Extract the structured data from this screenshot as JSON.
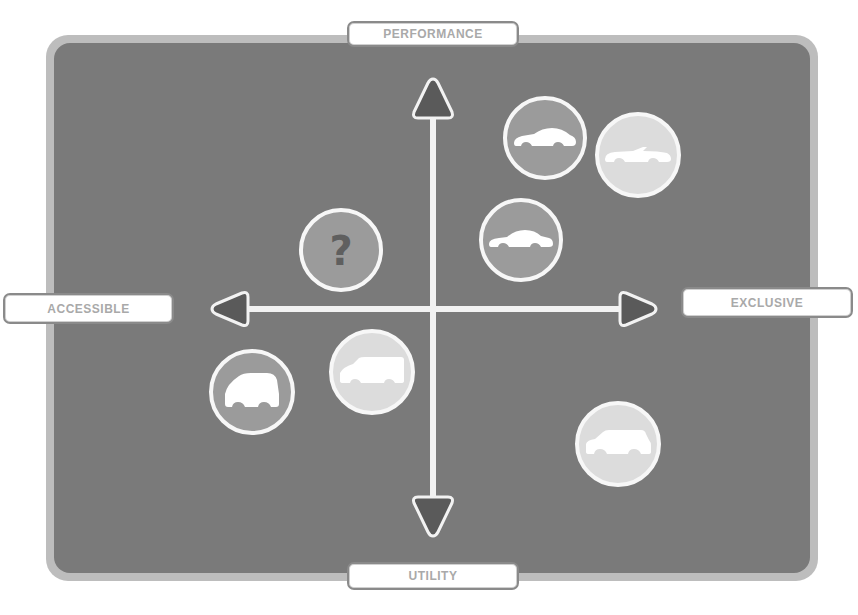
{
  "diagram": {
    "type": "positioning-map",
    "axes": {
      "top": "PERFORMANCE",
      "bottom": "UTILITY",
      "left": "ACCESSIBLE",
      "right": "EXCLUSIVE"
    },
    "items": [
      {
        "id": "coupe",
        "icon": "sports-coupe-icon",
        "quadrant": "performance-exclusive",
        "fill": "mid"
      },
      {
        "id": "convertible",
        "icon": "convertible-icon",
        "quadrant": "performance-exclusive",
        "fill": "light"
      },
      {
        "id": "sedan",
        "icon": "sedan-icon",
        "quadrant": "performance-exclusive",
        "fill": "mid"
      },
      {
        "id": "unknown",
        "icon": "question-mark-icon",
        "label": "?",
        "quadrant": "performance-accessible",
        "fill": "mid"
      },
      {
        "id": "hatchback",
        "icon": "small-hatchback-icon",
        "quadrant": "utility-accessible",
        "fill": "mid"
      },
      {
        "id": "mpv",
        "icon": "mpv-van-icon",
        "quadrant": "utility-accessible",
        "fill": "light"
      },
      {
        "id": "suv",
        "icon": "suv-icon",
        "quadrant": "utility-exclusive",
        "fill": "light"
      }
    ],
    "colors": {
      "background": "#7a7a7a",
      "frame": "#bdbdbd",
      "circle_mid": "#9b9b9b",
      "circle_light": "#dcdcdc",
      "axis": "#f2f2f2",
      "arrowhead": "#5a5a5a",
      "label_text": "#a9a9a9"
    }
  }
}
